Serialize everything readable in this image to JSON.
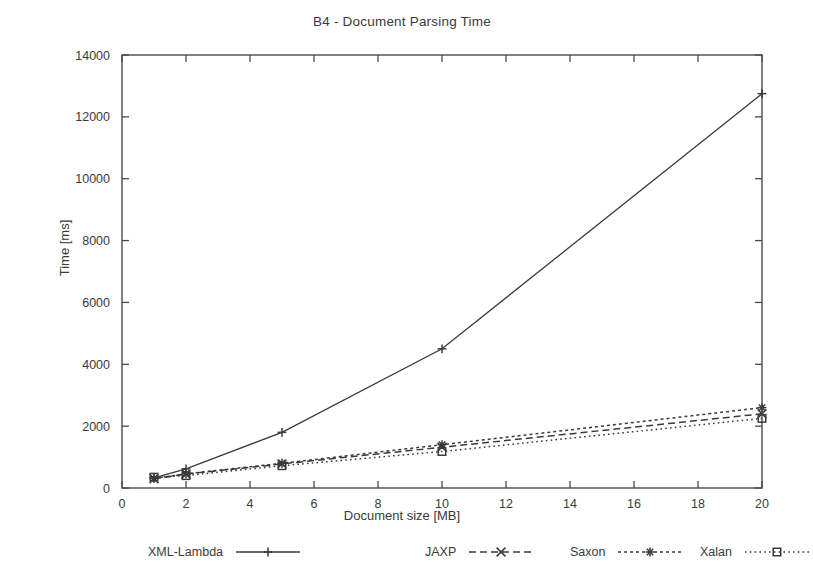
{
  "chart_data": {
    "type": "line",
    "title": "B4 - Document Parsing Time",
    "xlabel": "Document size [MB]",
    "ylabel": "Time [ms]",
    "xlim": [
      0,
      20
    ],
    "ylim": [
      0,
      14000
    ],
    "xticks": [
      0,
      2,
      4,
      6,
      8,
      10,
      12,
      14,
      16,
      18,
      20
    ],
    "xtick_labels": [
      "0",
      "2",
      "4",
      "6",
      "8",
      "10",
      "12",
      "14",
      "16",
      "18",
      "20"
    ],
    "yticks": [
      0,
      2000,
      4000,
      6000,
      8000,
      10000,
      12000,
      14000
    ],
    "ytick_labels": [
      "0",
      "2000",
      "4000",
      "6000",
      "8000",
      "10000",
      "12000",
      "14000"
    ],
    "grid": false,
    "legend_position": "below",
    "x": [
      1,
      2,
      5,
      10,
      20
    ],
    "series": [
      {
        "name": "XML-Lambda",
        "values": [
          330,
          620,
          1800,
          4500,
          12750
        ],
        "line_style": "solid",
        "marker": "plus",
        "color": "#3a3a3a"
      },
      {
        "name": "JAXP",
        "values": [
          300,
          450,
          780,
          1320,
          2400
        ],
        "line_style": "dashed",
        "marker": "cross",
        "color": "#3a3a3a"
      },
      {
        "name": "Saxon",
        "values": [
          310,
          460,
          800,
          1400,
          2600
        ],
        "line_style": "dotted",
        "marker": "asterisk",
        "color": "#3a3a3a"
      },
      {
        "name": "Xalan",
        "values": [
          350,
          400,
          720,
          1180,
          2250
        ],
        "line_style": "fine-dotted",
        "marker": "square",
        "color": "#3a3a3a"
      }
    ]
  },
  "legend": {
    "entries": [
      {
        "label": "XML-Lambda"
      },
      {
        "label": "JAXP"
      },
      {
        "label": "Saxon"
      },
      {
        "label": "Xalan"
      }
    ]
  },
  "colors": {
    "ink": "#3a3a3a",
    "frame": "#4a4a4a",
    "background": "#ffffff"
  }
}
